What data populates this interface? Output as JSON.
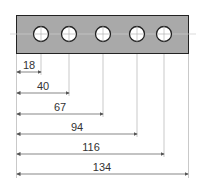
{
  "diagram": {
    "type": "hole-position-dimension-drawing",
    "plate": {
      "fill": "#a9a9a9",
      "stroke": "#222222"
    },
    "holes": [
      {
        "label": "hole-1",
        "position": 18
      },
      {
        "label": "hole-2",
        "position": 40
      },
      {
        "label": "hole-3",
        "position": 67
      },
      {
        "label": "hole-4",
        "position": 94
      },
      {
        "label": "hole-5",
        "position": 116
      }
    ],
    "dimensions": [
      {
        "value": "18"
      },
      {
        "value": "40"
      },
      {
        "value": "67"
      },
      {
        "value": "94"
      },
      {
        "value": "116"
      },
      {
        "value": "134"
      }
    ],
    "total_length": 134
  }
}
